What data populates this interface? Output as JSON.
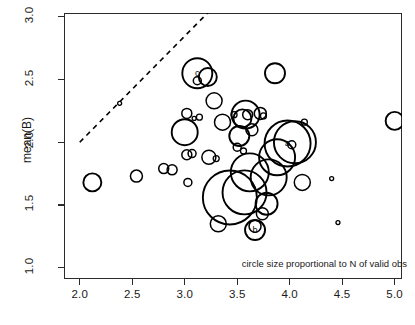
{
  "chart_data": {
    "type": "scatter",
    "title": "",
    "xlabel": "",
    "ylabel": "mean(B)",
    "xlim": [
      1.85,
      5.07
    ],
    "ylim": [
      0.91,
      3.03
    ],
    "xticks": [
      2.0,
      2.5,
      3.0,
      3.5,
      4.0,
      4.5,
      5.0
    ],
    "xticklabels": [
      "2.0",
      "2.5",
      "3.0",
      "3.5",
      "4.0",
      "4.5",
      "5.0"
    ],
    "yticks": [
      1.0,
      1.5,
      2.0,
      2.5,
      3.0
    ],
    "yticklabels": [
      "1.0",
      "1.5",
      "2.0",
      "2.5",
      "3.0"
    ],
    "grid": false,
    "legend": null,
    "annotation": "circle size proportional to N of valid obs",
    "size_encoding": "circle size proportional to N of valid obs",
    "reference_line": {
      "style": "dashed",
      "note": "identity line y = x",
      "x": [
        2.0,
        3.23
      ],
      "y": [
        2.0,
        3.04
      ]
    },
    "points": [
      {
        "x": 2.12,
        "y": 1.68,
        "r": 9,
        "label": ""
      },
      {
        "x": 2.38,
        "y": 2.31,
        "r": 2,
        "label": ""
      },
      {
        "x": 2.54,
        "y": 1.73,
        "r": 6,
        "label": ""
      },
      {
        "x": 2.8,
        "y": 1.79,
        "r": 5,
        "label": ""
      },
      {
        "x": 2.88,
        "y": 1.78,
        "r": 5,
        "label": ""
      },
      {
        "x": 3.0,
        "y": 2.08,
        "r": 13,
        "label": ""
      },
      {
        "x": 3.02,
        "y": 2.23,
        "r": 5,
        "label": ""
      },
      {
        "x": 3.02,
        "y": 1.9,
        "r": 5,
        "label": ""
      },
      {
        "x": 3.03,
        "y": 1.68,
        "r": 4,
        "label": ""
      },
      {
        "x": 3.07,
        "y": 1.91,
        "r": 4,
        "label": ""
      },
      {
        "x": 3.09,
        "y": 2.19,
        "r": 2,
        "label": ""
      },
      {
        "x": 3.12,
        "y": 2.55,
        "r": 15,
        "label": "c"
      },
      {
        "x": 3.12,
        "y": 2.49,
        "r": 4,
        "label": ""
      },
      {
        "x": 3.14,
        "y": 2.2,
        "r": 3,
        "label": ""
      },
      {
        "x": 3.22,
        "y": 2.52,
        "r": 9,
        "label": ""
      },
      {
        "x": 3.23,
        "y": 1.88,
        "r": 7,
        "label": ""
      },
      {
        "x": 3.28,
        "y": 2.33,
        "r": 8,
        "label": ""
      },
      {
        "x": 3.3,
        "y": 1.87,
        "r": 3,
        "label": ""
      },
      {
        "x": 3.32,
        "y": 1.35,
        "r": 8,
        "label": ""
      },
      {
        "x": 3.36,
        "y": 2.16,
        "r": 8,
        "label": ""
      },
      {
        "x": 3.43,
        "y": 1.56,
        "r": 27,
        "label": ""
      },
      {
        "x": 3.47,
        "y": 2.22,
        "r": 3,
        "label": ""
      },
      {
        "x": 3.5,
        "y": 1.96,
        "r": 4,
        "label": ""
      },
      {
        "x": 3.52,
        "y": 2.05,
        "r": 10,
        "label": ""
      },
      {
        "x": 3.55,
        "y": 2.19,
        "r": 9,
        "label": ""
      },
      {
        "x": 3.56,
        "y": 1.93,
        "r": 3,
        "label": ""
      },
      {
        "x": 3.57,
        "y": 1.6,
        "r": 22,
        "label": ""
      },
      {
        "x": 3.58,
        "y": 2.22,
        "r": 14,
        "label": ""
      },
      {
        "x": 3.6,
        "y": 2.22,
        "r": 5,
        "label": ""
      },
      {
        "x": 3.62,
        "y": 1.76,
        "r": 19,
        "label": ""
      },
      {
        "x": 3.64,
        "y": 2.1,
        "r": 6,
        "label": ""
      },
      {
        "x": 3.67,
        "y": 1.3,
        "r": 10,
        "label": "b"
      },
      {
        "x": 3.67,
        "y": 1.33,
        "r": 6,
        "label": ""
      },
      {
        "x": 3.72,
        "y": 2.23,
        "r": 6,
        "label": ""
      },
      {
        "x": 3.74,
        "y": 1.43,
        "r": 6,
        "label": ""
      },
      {
        "x": 3.75,
        "y": 2.21,
        "r": 3,
        "label": ""
      },
      {
        "x": 3.78,
        "y": 1.51,
        "r": 11,
        "label": ""
      },
      {
        "x": 3.8,
        "y": 1.72,
        "r": 18,
        "label": ""
      },
      {
        "x": 3.86,
        "y": 2.55,
        "r": 10,
        "label": ""
      },
      {
        "x": 3.88,
        "y": 1.88,
        "r": 18,
        "label": ""
      },
      {
        "x": 3.98,
        "y": 1.99,
        "r": 23,
        "label": "a"
      },
      {
        "x": 4.02,
        "y": 1.98,
        "r": 4,
        "label": ""
      },
      {
        "x": 4.05,
        "y": 2.0,
        "r": 21,
        "label": ""
      },
      {
        "x": 4.12,
        "y": 1.68,
        "r": 8,
        "label": ""
      },
      {
        "x": 4.14,
        "y": 2.16,
        "r": 3,
        "label": ""
      },
      {
        "x": 4.4,
        "y": 1.71,
        "r": 2,
        "label": ""
      },
      {
        "x": 4.46,
        "y": 1.36,
        "r": 2,
        "label": ""
      },
      {
        "x": 5.0,
        "y": 2.17,
        "r": 9,
        "label": ""
      }
    ]
  }
}
